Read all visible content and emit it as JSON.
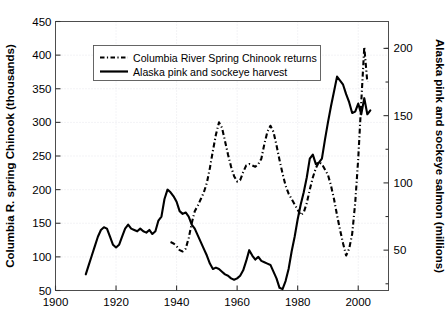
{
  "chart_data": {
    "type": "line",
    "title": "",
    "xlabel": "",
    "ylabel": "Columbia R. spring Chinook (thousands)",
    "y2label": "Alaska pink and sockeye salmon (millions)",
    "grid": true,
    "legend_position": "upper-left-inside",
    "xlim": [
      1900,
      2010
    ],
    "ylim": [
      50,
      450
    ],
    "y2lim": [
      20.0,
      220.0
    ],
    "xticks": [
      1900,
      1920,
      1940,
      1960,
      1980,
      2000
    ],
    "xticklabels": [
      "1900",
      "1920",
      "1940",
      "1960",
      "1980",
      "2000"
    ],
    "yticks": [
      50,
      100,
      150,
      200,
      250,
      300,
      350,
      400,
      450
    ],
    "yticklabels": [
      "50",
      "100",
      "150",
      "200",
      "250",
      "300",
      "350",
      "400",
      "450"
    ],
    "y2ticks": [
      50,
      100,
      150,
      200
    ],
    "y2ticklabels": [
      "50",
      "100",
      "150",
      "200"
    ],
    "series": [
      {
        "name": "Columbia River Spring Chinook returns",
        "axis": "left",
        "style": "dash-dot",
        "color": "#000000",
        "x": [
          1938,
          1939,
          1940,
          1941,
          1942,
          1943,
          1944,
          1945,
          1946,
          1947,
          1948,
          1949,
          1950,
          1951,
          1952,
          1953,
          1954,
          1955,
          1956,
          1957,
          1958,
          1959,
          1960,
          1961,
          1962,
          1963,
          1964,
          1965,
          1966,
          1967,
          1968,
          1969,
          1970,
          1971,
          1972,
          1973,
          1974,
          1975,
          1976,
          1977,
          1978,
          1979,
          1980,
          1981,
          1982,
          1983,
          1984,
          1985,
          1986,
          1987,
          1988,
          1989,
          1990,
          1991,
          1992,
          1993,
          1994,
          1995,
          1996,
          1997,
          1998,
          1999,
          2000,
          2001,
          2002,
          2003
        ],
        "y": [
          122,
          120,
          116,
          110,
          108,
          112,
          128,
          150,
          168,
          176,
          186,
          196,
          210,
          232,
          258,
          282,
          300,
          292,
          272,
          252,
          234,
          220,
          212,
          214,
          226,
          236,
          238,
          236,
          234,
          238,
          246,
          268,
          286,
          295,
          286,
          266,
          244,
          224,
          206,
          194,
          186,
          178,
          170,
          162,
          166,
          180,
          200,
          218,
          232,
          241,
          238,
          230,
          222,
          206,
          186,
          162,
          140,
          120,
          102,
          112,
          134,
          180,
          246,
          330,
          412,
          360
        ],
        "notes": "Dash-dot black line, left axis, thousands of fish"
      },
      {
        "name": "Alaska pink and sockeye harvest",
        "axis": "right",
        "style": "solid",
        "color": "#000000",
        "x": [
          1910,
          1911,
          1912,
          1913,
          1914,
          1915,
          1916,
          1917,
          1918,
          1919,
          1920,
          1921,
          1922,
          1923,
          1924,
          1925,
          1926,
          1927,
          1928,
          1929,
          1930,
          1931,
          1932,
          1933,
          1934,
          1935,
          1936,
          1937,
          1938,
          1939,
          1940,
          1941,
          1942,
          1943,
          1944,
          1945,
          1946,
          1947,
          1948,
          1949,
          1950,
          1951,
          1952,
          1953,
          1954,
          1955,
          1956,
          1957,
          1958,
          1959,
          1960,
          1961,
          1962,
          1963,
          1964,
          1965,
          1966,
          1967,
          1968,
          1969,
          1970,
          1971,
          1972,
          1973,
          1974,
          1975,
          1976,
          1977,
          1978,
          1979,
          1980,
          1981,
          1982,
          1983,
          1984,
          1985,
          1986,
          1987,
          1988,
          1989,
          1990,
          1991,
          1992,
          1993,
          1994,
          1995,
          1996,
          1997,
          1998,
          1999,
          2000,
          2001,
          2002,
          2003,
          2004
        ],
        "y_left_scale": [
          84,
          98,
          112,
          126,
          140,
          150,
          153,
          152,
          140,
          128,
          124,
          128,
          140,
          152,
          158,
          152,
          150,
          148,
          152,
          148,
          146,
          150,
          144,
          148,
          164,
          170,
          196,
          210,
          206,
          200,
          192,
          178,
          174,
          176,
          170,
          158,
          152,
          142,
          132,
          122,
          112,
          100,
          92,
          94,
          92,
          88,
          84,
          82,
          79,
          77,
          78,
          82,
          90,
          104,
          120,
          112,
          106,
          110,
          104,
          102,
          100,
          98,
          88,
          78,
          62,
          60,
          72,
          92,
          118,
          140,
          166,
          188,
          206,
          228,
          256,
          262,
          248,
          250,
          256,
          284,
          310,
          334,
          356,
          377,
          372,
          366,
          352,
          340,
          324,
          326,
          338,
          322,
          346,
          322,
          328
        ],
        "y": [
          32,
          39,
          46,
          53,
          60,
          65,
          67,
          66,
          60,
          54,
          52,
          54,
          60,
          66,
          69,
          66,
          65,
          64,
          66,
          64,
          63,
          65,
          62,
          64,
          72,
          75,
          88,
          95,
          93,
          90,
          86,
          79,
          77,
          78,
          75,
          69,
          66,
          61,
          56,
          51,
          46,
          40,
          36,
          37,
          36,
          34,
          32,
          31,
          29,
          28,
          29,
          31,
          35,
          42,
          50,
          46,
          43,
          45,
          42,
          41,
          40,
          39,
          34,
          29,
          22,
          21,
          27,
          36,
          49,
          60,
          73,
          84,
          93,
          104,
          118,
          121,
          114,
          115,
          118,
          132,
          145,
          157,
          168,
          179,
          176,
          173,
          166,
          160,
          152,
          153,
          159,
          151,
          163,
          151,
          154
        ],
        "notes": "Solid black line, right axis, millions of salmon"
      }
    ],
    "legend": [
      {
        "label": "Columbia River Spring Chinook returns",
        "style": "dash-dot"
      },
      {
        "label": "Alaska pink and sockeye harvest",
        "style": "solid"
      }
    ]
  }
}
